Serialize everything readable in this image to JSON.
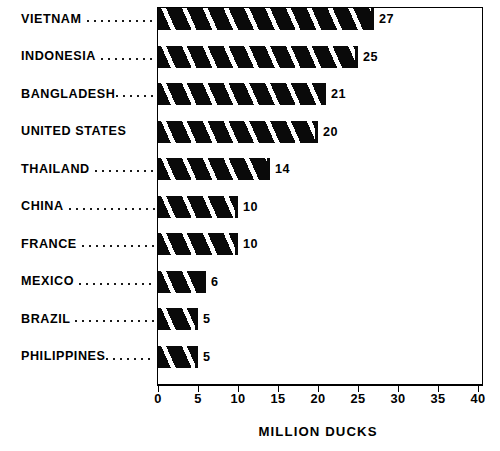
{
  "chart_data": {
    "type": "bar",
    "orientation": "horizontal",
    "title": "",
    "subtitle": "",
    "xlabel": "MILLION DUCKS",
    "ylabel": "",
    "categories": [
      "VIETNAM",
      "INDONESIA",
      "BANGLADESH",
      "UNITED STATES",
      "THAILAND",
      "CHINA",
      "FRANCE",
      "MEXICO",
      "BRAZIL",
      "PHILIPPINES"
    ],
    "values": [
      27,
      25,
      21,
      20,
      14,
      10,
      10,
      6,
      5,
      5
    ],
    "data_labels": [
      "27",
      "25",
      "21",
      "20",
      "14",
      "10",
      "10",
      "6",
      "5",
      "5"
    ],
    "xlim": [
      0,
      40
    ],
    "xticks": [
      0,
      5,
      10,
      15,
      20,
      25,
      30,
      35,
      40
    ],
    "xtick_labels": [
      "0",
      "5",
      "10",
      "15",
      "20",
      "25",
      "30",
      "35",
      "40"
    ],
    "grid": false,
    "legend": false,
    "legend_position": "none",
    "units": "million ducks",
    "bar_fill": "#0a0a0a",
    "bar_pattern": "diagonal-stripe",
    "frame_color": "#000000",
    "background": "#ffffff",
    "leader_style": "dotted",
    "leaders": [
      6,
      4,
      1,
      0,
      5,
      8,
      7,
      7,
      8,
      4
    ]
  }
}
